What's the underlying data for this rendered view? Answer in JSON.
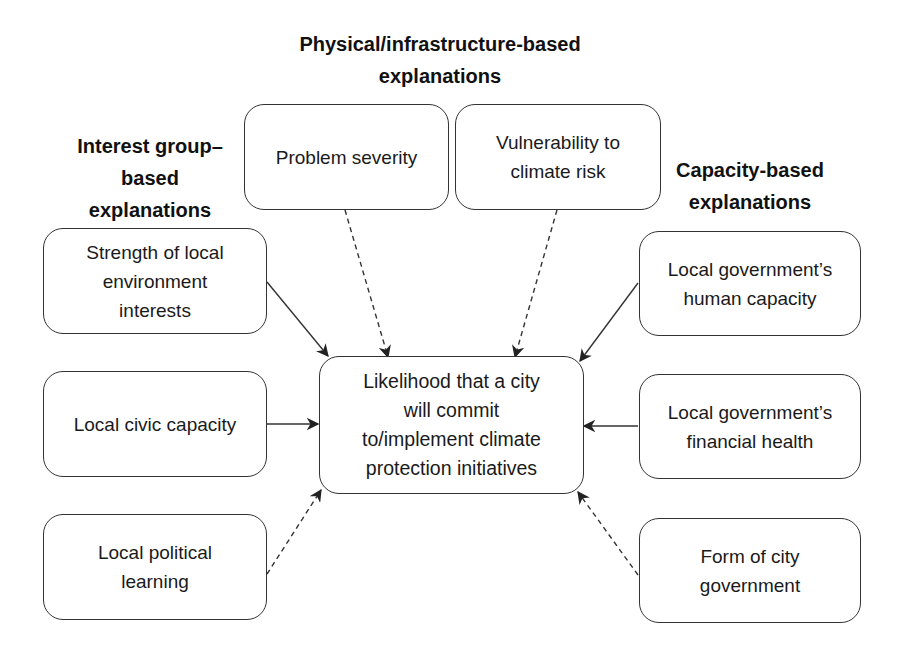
{
  "headings": {
    "physical": "Physical/infrastructure-based\nexplanations",
    "interest_group": "Interest group–\nbased\nexplanations",
    "capacity": "Capacity-based\nexplanations"
  },
  "center": {
    "label": "Likelihood that a city\nwill commit\nto/implement climate\nprotection initiatives"
  },
  "nodes": {
    "problem_severity": "Problem severity",
    "vulnerability": "Vulnerability to\nclimate risk",
    "env_interests": "Strength of local\nenvironment\ninterests",
    "civic_capacity": "Local civic capacity",
    "political_learning": "Local political\nlearning",
    "human_capacity": "Local government’s\nhuman capacity",
    "financial_health": "Local government’s\nfinancial health",
    "city_government_form": "Form of city\ngovernment"
  },
  "edges": [
    {
      "from": "problem_severity",
      "to": "center",
      "style": "dashed"
    },
    {
      "from": "vulnerability",
      "to": "center",
      "style": "dashed"
    },
    {
      "from": "env_interests",
      "to": "center",
      "style": "solid"
    },
    {
      "from": "civic_capacity",
      "to": "center",
      "style": "solid"
    },
    {
      "from": "political_learning",
      "to": "center",
      "style": "dashed"
    },
    {
      "from": "human_capacity",
      "to": "center",
      "style": "solid"
    },
    {
      "from": "financial_health",
      "to": "center",
      "style": "solid"
    },
    {
      "from": "city_government_form",
      "to": "center",
      "style": "dashed"
    }
  ],
  "colors": {
    "stroke": "#333333",
    "text": "#1a1a1a",
    "background": "#ffffff"
  }
}
